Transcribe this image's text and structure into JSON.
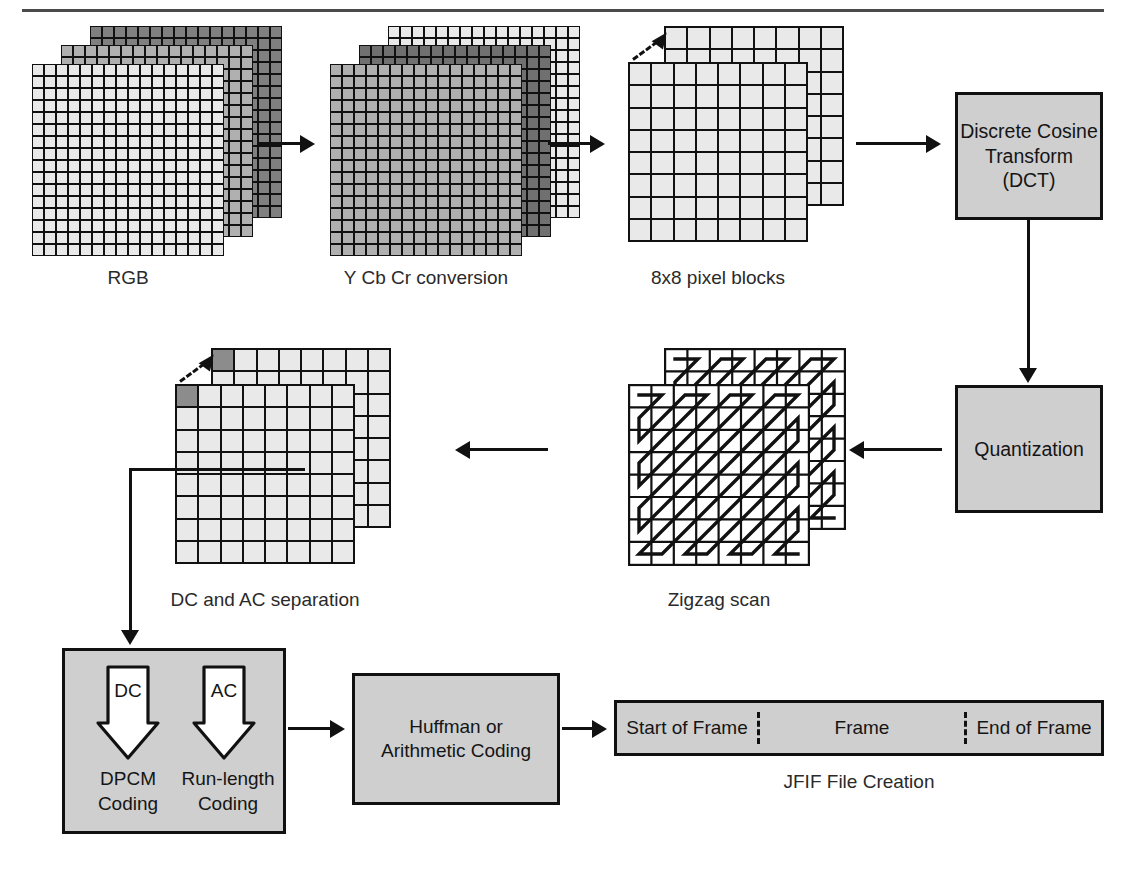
{
  "figure": {
    "top_rule": true
  },
  "colors": {
    "box_fill": "#cfcfcf",
    "outline": "#111111",
    "cell_light": "#e9e9e9",
    "cell_medium": "#b0b0b0",
    "cell_dark": "#808080",
    "cell_dc_highlight": "#8c8c8c",
    "text": "#1a1a1a"
  },
  "stages": {
    "rgb": {
      "caption": "RGB",
      "grid_cols": 16,
      "grid_rows": 16,
      "layers": 3,
      "layer_tones": [
        "#808080",
        "#b0b0b0",
        "#e9e9e9"
      ]
    },
    "ycbcr": {
      "caption": "Y Cb Cr conversion",
      "grid_cols": 16,
      "grid_rows": 16,
      "layers": 3,
      "layer_tones": [
        "#e9e9e9",
        "#707070",
        "#b0b0b0"
      ]
    },
    "blocks": {
      "caption": "8x8 pixel blocks",
      "grid_cols": 8,
      "grid_rows": 8,
      "layers": 2,
      "layer_tones": [
        "#e9e9e9",
        "#e9e9e9"
      ],
      "pointer": "dashed-arrow-to-top-left-block"
    },
    "dct": {
      "label_line1": "Discrete Cosine",
      "label_line2": "Transform (DCT)"
    },
    "quantization": {
      "label": "Quantization"
    },
    "zigzag": {
      "caption": "Zigzag scan",
      "grid_cols": 8,
      "grid_rows": 8,
      "layers": 2
    },
    "dcac": {
      "caption": "DC and AC separation",
      "grid_cols": 8,
      "grid_rows": 8,
      "layers": 2,
      "highlight_cell": "top-left",
      "pointer": "dashed-arrow-to-top-left-block"
    },
    "entropy_inputs": {
      "dc_arrow_label": "DC",
      "ac_arrow_label": "AC",
      "dc_line1": "DPCM",
      "dc_line2": "Coding",
      "ac_line1": "Run-length",
      "ac_line2": "Coding"
    },
    "coding": {
      "label_line1": "Huffman or",
      "label_line2": "Arithmetic Coding"
    },
    "jfif": {
      "caption": "JFIF File Creation",
      "segments": [
        {
          "label": "Start of Frame"
        },
        {
          "label": "Frame"
        },
        {
          "label": "End of Frame"
        }
      ]
    }
  }
}
